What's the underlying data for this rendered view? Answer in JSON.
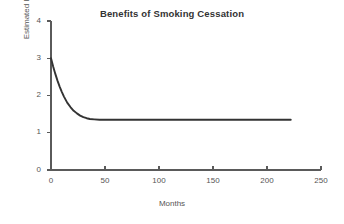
{
  "chart_data": {
    "type": "line",
    "title": "Benefits of Smoking Cessation",
    "xlabel": "Months",
    "ylabel": "Estimated Relative Risk of Stroke",
    "xlim": [
      0,
      250
    ],
    "ylim": [
      0,
      4
    ],
    "xticks": [
      0,
      50,
      100,
      150,
      200,
      250
    ],
    "yticks": [
      0,
      1,
      2,
      3,
      4
    ],
    "xtick_labels": [
      "0",
      "50",
      "100",
      "150",
      "200",
      "250"
    ],
    "ytick_labels": [
      "0",
      "1",
      "2",
      "3",
      "4"
    ],
    "grid": false,
    "legend": false,
    "series": [
      {
        "name": "Estimated Relative Risk of Stroke",
        "color": "#333333",
        "x": [
          0,
          2,
          4,
          6,
          8,
          10,
          12,
          15,
          18,
          21,
          24,
          27,
          30,
          33,
          36,
          40,
          45,
          50,
          60,
          70,
          80,
          90,
          100,
          110,
          120,
          130,
          140,
          150,
          160,
          170,
          180,
          190,
          200,
          210,
          222
        ],
        "y": [
          3.0,
          2.78,
          2.58,
          2.4,
          2.24,
          2.1,
          1.97,
          1.81,
          1.69,
          1.59,
          1.52,
          1.46,
          1.42,
          1.39,
          1.37,
          1.36,
          1.35,
          1.35,
          1.35,
          1.35,
          1.35,
          1.35,
          1.35,
          1.35,
          1.35,
          1.35,
          1.35,
          1.35,
          1.35,
          1.35,
          1.35,
          1.35,
          1.35,
          1.35,
          1.35
        ]
      }
    ],
    "annotations": [
      "Risk declines exponentially from 3.0 at cessation to a plateau near 1.35 by about month 45",
      "Curve is drawn from month 0 to month 222"
    ]
  },
  "style": {
    "axis_color": "#5a5a5a",
    "text_color": "#555555",
    "title_color": "#333333",
    "curve_color": "#333333",
    "background": "#ffffff"
  }
}
